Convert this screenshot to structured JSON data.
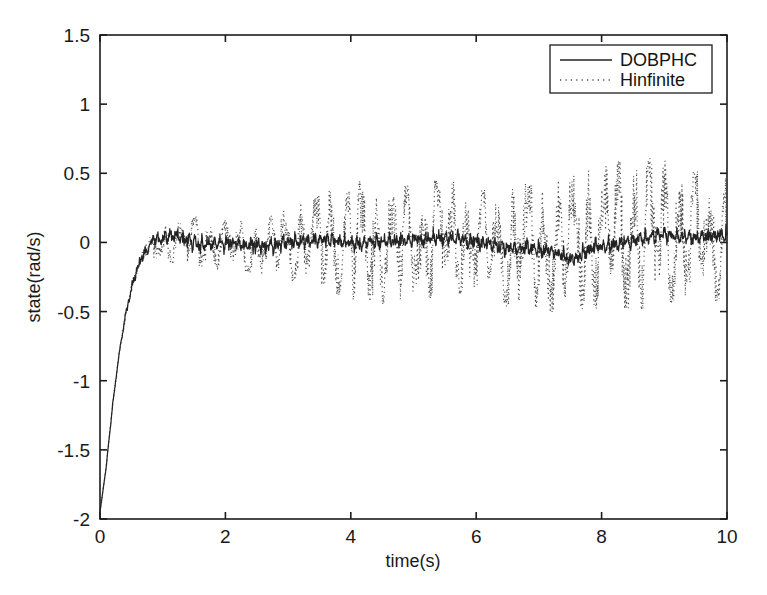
{
  "chart_data": {
    "type": "line",
    "title": "",
    "xlabel": "time(s)",
    "ylabel": "state(rad/s)",
    "xlim": [
      0,
      10
    ],
    "ylim": [
      -2,
      1.5
    ],
    "xticks": [
      0,
      2,
      4,
      6,
      8,
      10
    ],
    "xtick_labels": [
      "0",
      "2",
      "4",
      "6",
      "8",
      "10"
    ],
    "yticks": [
      -2,
      -1.5,
      -1,
      -0.5,
      0,
      0.5,
      1,
      1.5
    ],
    "ytick_labels": [
      "-2",
      "-1.5",
      "-1",
      "-0.5",
      "0",
      "0.5",
      "1",
      "1.5"
    ],
    "grid": false,
    "legend_position": "upper right",
    "legend_entries": [
      "DOBPHC",
      "Hinfinite"
    ],
    "series": [
      {
        "name": "DOBPHC",
        "style": "solid",
        "color": "#232323",
        "description": "step response from -1.95 rising to ~0 by t=0.8s, then tight low-amplitude noise band about zero (approx +/-0.07)",
        "noise_amplitude": 0.055,
        "settling_time": 0.85,
        "initial_value": -1.95,
        "steady_state_mean": 0.0,
        "envelope_points": [
          {
            "t": 0.0,
            "v": -1.95
          },
          {
            "t": 0.1,
            "v": -1.62
          },
          {
            "t": 0.2,
            "v": -1.18
          },
          {
            "t": 0.3,
            "v": -0.82
          },
          {
            "t": 0.4,
            "v": -0.54
          },
          {
            "t": 0.5,
            "v": -0.33
          },
          {
            "t": 0.6,
            "v": -0.18
          },
          {
            "t": 0.7,
            "v": -0.08
          },
          {
            "t": 0.85,
            "v": 0.02
          },
          {
            "t": 1.2,
            "v": 0.05
          },
          {
            "t": 1.6,
            "v": -0.02
          },
          {
            "t": 2.1,
            "v": 0.0
          },
          {
            "t": 2.6,
            "v": -0.03
          },
          {
            "t": 3.1,
            "v": 0.01
          },
          {
            "t": 3.6,
            "v": 0.02
          },
          {
            "t": 4.1,
            "v": -0.01
          },
          {
            "t": 4.6,
            "v": 0.01
          },
          {
            "t": 5.1,
            "v": 0.02
          },
          {
            "t": 5.6,
            "v": 0.04
          },
          {
            "t": 6.1,
            "v": -0.01
          },
          {
            "t": 6.6,
            "v": -0.04
          },
          {
            "t": 7.1,
            "v": -0.05
          },
          {
            "t": 7.5,
            "v": -0.12
          },
          {
            "t": 7.9,
            "v": -0.03
          },
          {
            "t": 8.4,
            "v": 0.0
          },
          {
            "t": 8.9,
            "v": 0.06
          },
          {
            "t": 9.4,
            "v": 0.03
          },
          {
            "t": 10.0,
            "v": 0.05
          }
        ]
      },
      {
        "name": "Hinfinite",
        "style": "dotted",
        "color": "#4a4a4a",
        "description": "same step response but with much larger steady-state oscillation; envelope grows from +/-0.12 near t=1 to about +0.63 / -0.55 near t=8.5-10",
        "initial_value": -1.95,
        "settling_time": 0.85,
        "steady_state_mean": 0.0,
        "envelope_upper": [
          {
            "t": 1.0,
            "v": 0.14
          },
          {
            "t": 1.5,
            "v": 0.19
          },
          {
            "t": 2.0,
            "v": 0.17
          },
          {
            "t": 2.5,
            "v": 0.15
          },
          {
            "t": 3.0,
            "v": 0.25
          },
          {
            "t": 3.5,
            "v": 0.34
          },
          {
            "t": 4.0,
            "v": 0.45
          },
          {
            "t": 4.5,
            "v": 0.44
          },
          {
            "t": 5.0,
            "v": 0.43
          },
          {
            "t": 5.5,
            "v": 0.47
          },
          {
            "t": 6.0,
            "v": 0.38
          },
          {
            "t": 6.5,
            "v": 0.42
          },
          {
            "t": 7.0,
            "v": 0.45
          },
          {
            "t": 7.5,
            "v": 0.48
          },
          {
            "t": 8.0,
            "v": 0.55
          },
          {
            "t": 8.5,
            "v": 0.63
          },
          {
            "t": 9.0,
            "v": 0.6
          },
          {
            "t": 9.5,
            "v": 0.52
          },
          {
            "t": 10.0,
            "v": 0.5
          }
        ],
        "envelope_lower": [
          {
            "t": 1.0,
            "v": -0.14
          },
          {
            "t": 1.5,
            "v": -0.17
          },
          {
            "t": 2.0,
            "v": -0.2
          },
          {
            "t": 2.5,
            "v": -0.23
          },
          {
            "t": 3.0,
            "v": -0.28
          },
          {
            "t": 3.5,
            "v": -0.34
          },
          {
            "t": 4.0,
            "v": -0.42
          },
          {
            "t": 4.5,
            "v": -0.45
          },
          {
            "t": 5.0,
            "v": -0.4
          },
          {
            "t": 5.5,
            "v": -0.42
          },
          {
            "t": 6.0,
            "v": -0.36
          },
          {
            "t": 6.5,
            "v": -0.47
          },
          {
            "t": 7.0,
            "v": -0.5
          },
          {
            "t": 7.5,
            "v": -0.52
          },
          {
            "t": 8.0,
            "v": -0.48
          },
          {
            "t": 8.5,
            "v": -0.5
          },
          {
            "t": 9.0,
            "v": -0.46
          },
          {
            "t": 9.5,
            "v": -0.44
          },
          {
            "t": 10.0,
            "v": -0.42
          }
        ]
      }
    ]
  },
  "axes": {
    "x_title": "time(s)",
    "y_title": "state(rad/s)"
  },
  "legend": {
    "items": [
      {
        "label": "DOBPHC",
        "style": "solid"
      },
      {
        "label": "Hinfinite",
        "style": "dotted"
      }
    ]
  },
  "colors": {
    "background": "#ffffff",
    "axis": "#1c1c1c",
    "solid_series": "#232323",
    "dotted_series": "#4a4a4a",
    "text": "#1a1a1a"
  }
}
